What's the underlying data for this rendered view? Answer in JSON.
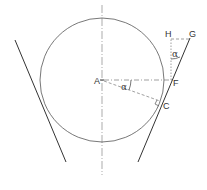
{
  "diagram": {
    "type": "geometry",
    "colors": {
      "stroke": "#444444",
      "thin_stroke": "#777777",
      "text": "#333333",
      "background": "#ffffff"
    },
    "circle": {
      "cx": 102,
      "cy": 80,
      "r": 62
    },
    "centerline": {
      "x": 102,
      "y1": 5,
      "y2": 175
    },
    "points": {
      "A": {
        "label": "A",
        "x": 102,
        "y": 80
      },
      "F": {
        "label": "F",
        "x": 170,
        "y": 80
      },
      "C": {
        "label": "C",
        "x": 161,
        "y": 102
      },
      "H": {
        "label": "H",
        "x": 171,
        "y": 39
      },
      "G": {
        "label": "G",
        "x": 190,
        "y": 39
      }
    },
    "lines": {
      "left_tangent": {
        "x1": 15,
        "y1": 40,
        "x2": 66,
        "y2": 162
      },
      "right_tangent": {
        "x1": 190,
        "y1": 38,
        "x2": 138,
        "y2": 162
      }
    },
    "angle_labels": [
      {
        "label": "α",
        "at": "A-F-C",
        "x": 122,
        "y": 89
      },
      {
        "label": "α",
        "at": "H-F-G",
        "x": 173,
        "y": 56
      }
    ]
  }
}
